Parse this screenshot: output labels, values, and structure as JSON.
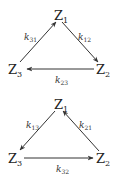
{
  "diagrams": [
    {
      "name": "cycle-clockwise",
      "nodes": {
        "z1": {
          "base": "Z",
          "sub": "1"
        },
        "z2": {
          "base": "Z",
          "sub": "2"
        },
        "z3": {
          "base": "Z",
          "sub": "3"
        }
      },
      "edges": [
        {
          "from": "Z3",
          "to": "Z1",
          "label_base": "k",
          "label_sub": "31"
        },
        {
          "from": "Z1",
          "to": "Z2",
          "label_base": "k",
          "label_sub": "12"
        },
        {
          "from": "Z2",
          "to": "Z3",
          "label_base": "k",
          "label_sub": "23"
        }
      ]
    },
    {
      "name": "cycle-counterclockwise",
      "nodes": {
        "z1": {
          "base": "Z",
          "sub": "1"
        },
        "z2": {
          "base": "Z",
          "sub": "2"
        },
        "z3": {
          "base": "Z",
          "sub": "3"
        }
      },
      "edges": [
        {
          "from": "Z1",
          "to": "Z3",
          "label_base": "k",
          "label_sub": "13"
        },
        {
          "from": "Z2",
          "to": "Z1",
          "label_base": "k",
          "label_sub": "21"
        },
        {
          "from": "Z3",
          "to": "Z2",
          "label_base": "k",
          "label_sub": "32"
        }
      ]
    }
  ],
  "colors": {
    "stroke": "#333333",
    "text": "#222222",
    "background": "#ffffff"
  }
}
